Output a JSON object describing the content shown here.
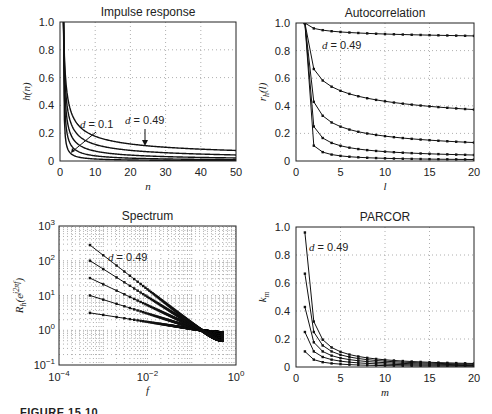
{
  "figure": {
    "caption": "FIGURE 15.10"
  },
  "chart_data": [
    {
      "id": "impulse",
      "type": "line",
      "title": "Impulse response",
      "xlabel": "n",
      "ylabel": "h(n)",
      "xlim": [
        0,
        50
      ],
      "ylim": [
        0,
        1.0
      ],
      "xticks": [
        0,
        10,
        20,
        30,
        40,
        50
      ],
      "yticks": [
        0,
        0.2,
        0.4,
        0.6,
        0.8,
        1.0
      ],
      "ytick_labels": [
        "0",
        "0.2",
        "0.4",
        "0.6",
        "0.8",
        "1.0"
      ],
      "grid": true,
      "markers": false,
      "d_values": [
        0.1,
        0.2,
        0.3,
        0.4,
        0.49
      ],
      "formula": "h(n) = Γ(n+d)/(Γ(n+1)Γ(d)), n = 0..50",
      "series": [
        {
          "name": "d = 0.1",
          "x": [
            1,
            2,
            3,
            5,
            10,
            20,
            30,
            40,
            50
          ],
          "values": [
            1.0,
            0.1,
            0.055,
            0.028,
            0.012,
            0.007,
            0.005,
            0.004,
            0.003
          ]
        },
        {
          "name": "d = 0.2",
          "x": [
            1,
            2,
            3,
            5,
            10,
            20,
            30,
            40,
            50
          ],
          "values": [
            1.0,
            0.2,
            0.12,
            0.068,
            0.034,
            0.019,
            0.013,
            0.011,
            0.009
          ]
        },
        {
          "name": "d = 0.3",
          "x": [
            1,
            2,
            3,
            5,
            10,
            20,
            30,
            40,
            50
          ],
          "values": [
            1.0,
            0.3,
            0.195,
            0.12,
            0.066,
            0.039,
            0.029,
            0.023,
            0.02
          ]
        },
        {
          "name": "d = 0.4",
          "x": [
            1,
            2,
            3,
            5,
            10,
            20,
            30,
            40,
            50
          ],
          "values": [
            1.0,
            0.4,
            0.28,
            0.18,
            0.11,
            0.068,
            0.053,
            0.044,
            0.038
          ]
        },
        {
          "name": "d = 0.49",
          "x": [
            1,
            2,
            3,
            5,
            10,
            20,
            30,
            40,
            50
          ],
          "values": [
            1.0,
            0.49,
            0.37,
            0.25,
            0.16,
            0.1,
            0.083,
            0.071,
            0.064
          ]
        }
      ],
      "annotations": [
        {
          "text": "d = 0.1",
          "arrow_to": [
            4,
            0.04
          ]
        },
        {
          "text": "d = 0.49",
          "arrow_to": [
            25,
            0.085
          ]
        }
      ]
    },
    {
      "id": "autocorr",
      "type": "line",
      "title": "Autocorrelation",
      "xlabel": "l",
      "ylabel": "r_h(l)",
      "xlim": [
        0,
        20
      ],
      "ylim": [
        0,
        1.0
      ],
      "xticks": [
        0,
        5,
        10,
        15,
        20
      ],
      "yticks": [
        0,
        0.2,
        0.4,
        0.6,
        0.8,
        1.0
      ],
      "ytick_labels": [
        "0",
        "0.2",
        "0.4",
        "0.6",
        "0.8",
        "1.0"
      ],
      "grid": true,
      "markers": true,
      "d_values": [
        0.1,
        0.2,
        0.3,
        0.4,
        0.49
      ],
      "formula": "r(1)=1, r(l+1)=r(l)*(l-1+d)/(l-d)",
      "series": [
        {
          "name": "d = 0.49",
          "x": [
            1,
            2,
            3,
            5,
            10,
            15,
            20
          ],
          "values": [
            1.0,
            0.96,
            0.94,
            0.93,
            0.915,
            0.905,
            0.9
          ]
        },
        {
          "name": "d = 0.4",
          "x": [
            1,
            2,
            3,
            5,
            10,
            15,
            20
          ],
          "values": [
            1.0,
            0.667,
            0.58,
            0.5,
            0.42,
            0.385,
            0.36
          ]
        },
        {
          "name": "d = 0.3",
          "x": [
            1,
            2,
            3,
            5,
            10,
            15,
            20
          ],
          "values": [
            1.0,
            0.43,
            0.33,
            0.25,
            0.17,
            0.14,
            0.12
          ]
        },
        {
          "name": "d = 0.2",
          "x": [
            1,
            2,
            3,
            5,
            10,
            15,
            20
          ],
          "values": [
            1.0,
            0.25,
            0.17,
            0.11,
            0.06,
            0.04,
            0.03
          ]
        },
        {
          "name": "d = 0.1",
          "x": [
            1,
            2,
            3,
            5,
            10,
            15,
            20
          ],
          "values": [
            1.0,
            0.11,
            0.06,
            0.03,
            0.013,
            0.008,
            0.005
          ]
        }
      ],
      "annotations": [
        {
          "text": "d = 0.49",
          "at": [
            3,
            0.86
          ]
        }
      ]
    },
    {
      "id": "spectrum",
      "type": "line",
      "title": "Spectrum",
      "xlabel": "f",
      "ylabel": "R_h(e^{j2πf})",
      "xscale": "log",
      "yscale": "log",
      "xlim": [
        0.0001,
        1
      ],
      "ylim": [
        0.1,
        1000
      ],
      "xticks": [
        0.0001,
        0.01,
        1
      ],
      "xtick_labels": [
        "10^-4",
        "10^-2",
        "10^0"
      ],
      "yticks": [
        0.1,
        1,
        10,
        100,
        1000
      ],
      "ytick_labels": [
        "10^-1",
        "10^0",
        "10^1",
        "10^2",
        "10^3"
      ],
      "grid": true,
      "markers": true,
      "d_values": [
        0.1,
        0.2,
        0.3,
        0.4,
        0.49
      ],
      "formula": "R(f) = |2 sin(πf)|^(-2d), f from 1/2000 to 0.5",
      "series": [
        {
          "name": "d = 0.49",
          "x": [
            0.0005,
            0.005,
            0.05,
            0.5
          ],
          "values": [
            280,
            29,
            3.0,
            0.51
          ]
        },
        {
          "name": "d = 0.4",
          "x": [
            0.0005,
            0.005,
            0.05,
            0.5
          ],
          "values": [
            100,
            16,
            2.5,
            0.57
          ]
        },
        {
          "name": "d = 0.3",
          "x": [
            0.0005,
            0.005,
            0.05,
            0.5
          ],
          "values": [
            31,
            8.1,
            2.0,
            0.66
          ]
        },
        {
          "name": "d = 0.2",
          "x": [
            0.0005,
            0.005,
            0.05,
            0.5
          ],
          "values": [
            10,
            4.0,
            1.6,
            0.76
          ]
        },
        {
          "name": "d = 0.1",
          "x": [
            0.0005,
            0.005,
            0.05,
            0.5
          ],
          "values": [
            3.1,
            2.0,
            1.26,
            0.87
          ]
        }
      ],
      "annotations": [
        {
          "text": "d = 0.49",
          "at": [
            0.003,
            150
          ]
        }
      ]
    },
    {
      "id": "parcor",
      "type": "line",
      "title": "PARCOR",
      "xlabel": "m",
      "ylabel": "k_m",
      "xlim": [
        0,
        20
      ],
      "ylim": [
        0,
        1.0
      ],
      "xticks": [
        0,
        5,
        10,
        15,
        20
      ],
      "yticks": [
        0,
        0.2,
        0.4,
        0.6,
        0.8,
        1.0
      ],
      "ytick_labels": [
        "0",
        "0.2",
        "0.4",
        "0.6",
        "0.8",
        "1.0"
      ],
      "grid": true,
      "markers": true,
      "d_values": [
        0.1,
        0.2,
        0.3,
        0.4,
        0.49
      ],
      "formula": "k_m = d/(m-d), m = 1..20",
      "series": [
        {
          "name": "d = 0.49",
          "x": [
            1,
            2,
            3,
            5,
            10,
            20
          ],
          "values": [
            0.96,
            0.32,
            0.195,
            0.11,
            0.05,
            0.025
          ]
        },
        {
          "name": "d = 0.4",
          "x": [
            1,
            2,
            3,
            5,
            10,
            20
          ],
          "values": [
            0.667,
            0.25,
            0.154,
            0.087,
            0.042,
            0.02
          ]
        },
        {
          "name": "d = 0.3",
          "x": [
            1,
            2,
            3,
            5,
            10,
            20
          ],
          "values": [
            0.43,
            0.176,
            0.111,
            0.064,
            0.031,
            0.015
          ]
        },
        {
          "name": "d = 0.2",
          "x": [
            1,
            2,
            3,
            5,
            10,
            20
          ],
          "values": [
            0.25,
            0.111,
            0.071,
            0.042,
            0.02,
            0.01
          ]
        },
        {
          "name": "d = 0.1",
          "x": [
            1,
            2,
            3,
            5,
            10,
            20
          ],
          "values": [
            0.11,
            0.053,
            0.034,
            0.02,
            0.01,
            0.005
          ]
        }
      ],
      "annotations": [
        {
          "text": "d = 0.49",
          "at": [
            1.7,
            0.85
          ]
        }
      ]
    }
  ]
}
